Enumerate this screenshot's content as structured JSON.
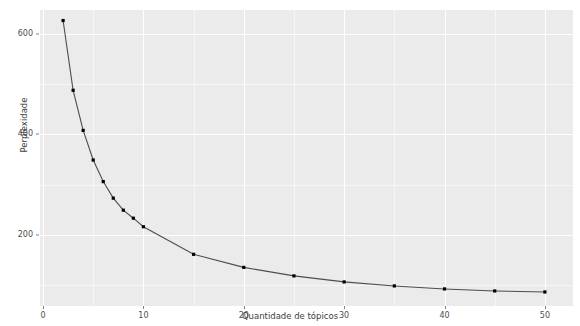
{
  "chart_data": {
    "type": "line",
    "title": "",
    "subtitle": "",
    "xlabel": "Quantidade de tópicos",
    "ylabel": "Perplexidade",
    "x": [
      2,
      3,
      4,
      5,
      6,
      7,
      8,
      9,
      10,
      15,
      20,
      25,
      30,
      35,
      40,
      45,
      50
    ],
    "values": [
      627,
      488,
      408,
      349,
      306,
      273,
      249,
      233,
      216,
      161,
      135,
      118,
      106,
      98,
      92,
      88,
      86
    ],
    "series": [
      {
        "name": "Perplexidade",
        "values": [
          627,
          488,
          408,
          349,
          306,
          273,
          249,
          233,
          216,
          161,
          135,
          118,
          106,
          98,
          92,
          88,
          86
        ]
      }
    ],
    "xlim": [
      -0.3,
      52.8
    ],
    "ylim": [
      58,
      648
    ],
    "xticks": [
      0,
      10,
      20,
      30,
      40,
      50
    ],
    "xtick_labels": [
      "0",
      "10",
      "20",
      "30",
      "40",
      "50"
    ],
    "yticks": [
      200,
      400,
      600
    ],
    "ytick_labels": [
      "200",
      "400",
      "600"
    ],
    "y_minor_ticks": [
      100,
      300,
      500
    ],
    "x_minor_ticks": [
      5,
      15,
      25,
      35,
      45
    ],
    "grid": true,
    "legend": "none",
    "marker": "point",
    "line_color": "#4d4d4d",
    "marker_color": "#000000",
    "panel_color": "#ebebeb",
    "grid_color": "#ffffff",
    "annotations": []
  }
}
